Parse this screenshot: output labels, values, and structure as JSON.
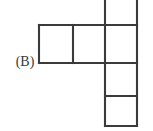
{
  "figure": {
    "label": "(B)",
    "label_name": "figure-label-b",
    "shape_kind": "polyomino-net",
    "background_color": "#ffffff",
    "line_color": "#3b3b3b",
    "line_width_px": 2.1,
    "cell_size_px": 33,
    "canvas": {
      "width_px": 153,
      "height_px": 131
    },
    "grid_origin": {
      "x_px": 39,
      "y_px": -8
    },
    "cells": [
      {
        "name": "cell-col3-row0",
        "col": 2,
        "row": 0,
        "x": 105,
        "y": -8,
        "w": 32,
        "h": 33,
        "clipped_top": true
      },
      {
        "name": "cell-col1-row1",
        "col": 0,
        "row": 1,
        "x": 39,
        "y": 25,
        "w": 34,
        "h": 38
      },
      {
        "name": "cell-col2-row1",
        "col": 1,
        "row": 1,
        "x": 73,
        "y": 25,
        "w": 32,
        "h": 38
      },
      {
        "name": "cell-col3-row1",
        "col": 2,
        "row": 1,
        "x": 105,
        "y": 25,
        "w": 32,
        "h": 38
      },
      {
        "name": "cell-col3-row2",
        "col": 2,
        "row": 2,
        "x": 105,
        "y": 63,
        "w": 32,
        "h": 33
      },
      {
        "name": "cell-col3-row3",
        "col": 2,
        "row": 3,
        "x": 105,
        "y": 96,
        "w": 32,
        "h": 30
      }
    ],
    "segments": [
      {
        "name": "edge-row-top",
        "x1": 39,
        "y1": 25,
        "x2": 137,
        "y2": 25
      },
      {
        "name": "edge-row-bottom",
        "x1": 39,
        "y1": 63,
        "x2": 105,
        "y2": 63
      },
      {
        "name": "edge-column-divider-row2",
        "x1": 105,
        "y1": 63,
        "x2": 137,
        "y2": 63
      },
      {
        "name": "edge-column-divider-row3",
        "x1": 105,
        "y1": 96,
        "x2": 137,
        "y2": 96
      },
      {
        "name": "edge-bottom",
        "x1": 105,
        "y1": 126,
        "x2": 137,
        "y2": 126
      },
      {
        "name": "edge-left",
        "x1": 39,
        "y1": 25,
        "x2": 39,
        "y2": 63
      },
      {
        "name": "edge-inner-vertical",
        "x1": 73,
        "y1": 25,
        "x2": 73,
        "y2": 63
      },
      {
        "name": "edge-column-left",
        "x1": 105,
        "y1": -8,
        "x2": 105,
        "y2": 126
      },
      {
        "name": "edge-column-right",
        "x1": 137,
        "y1": -8,
        "x2": 137,
        "y2": 126
      }
    ]
  }
}
